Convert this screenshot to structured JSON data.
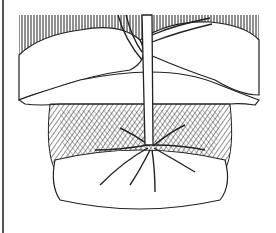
{
  "illustration": {
    "subject": "tree planted in a wide hole with spreading roots",
    "style": "black and white pen line drawing with hatching",
    "colors": {
      "ink": "#222222",
      "paper": "#ffffff",
      "rule": "#555555"
    }
  }
}
